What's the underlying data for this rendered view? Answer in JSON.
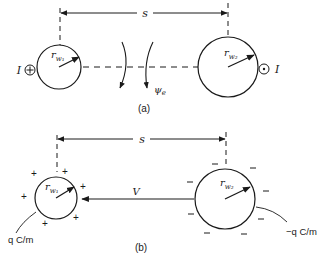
{
  "figure": {
    "panel_a": {
      "caption": "(a)",
      "dimension_label": "s",
      "left_conductor": {
        "radius_label": "r",
        "radius_subscript": "w₁",
        "current_label": "I",
        "current_symbol": "into-page (⊕)"
      },
      "right_conductor": {
        "radius_label": "r",
        "radius_subscript": "w₂",
        "current_label": "I",
        "current_symbol": "out-of-page (⊙)"
      },
      "flux_label": "ψ",
      "flux_subscript": "e"
    },
    "panel_b": {
      "caption": "(b)",
      "dimension_label": "s",
      "voltage_label": "V",
      "left_conductor": {
        "radius_label": "r",
        "radius_subscript": "w₁",
        "charge_label": "q C/m",
        "charge_sign": "+"
      },
      "right_conductor": {
        "radius_label": "r",
        "radius_subscript": "w₂",
        "charge_label": "−q C/m",
        "charge_sign": "−"
      }
    }
  },
  "colors": {
    "ink": "#1a1a1a",
    "background": "#ffffff"
  }
}
